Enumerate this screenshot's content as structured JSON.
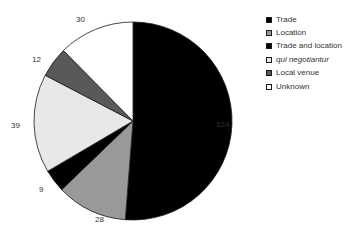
{
  "chart_data": {
    "type": "pie",
    "title": "",
    "total": 242,
    "labels": [
      "Trade",
      "Location",
      "Trade and location",
      "qui negotiantur",
      "Local venue",
      "Unknown"
    ],
    "values": [
      124,
      28,
      9,
      39,
      12,
      30
    ],
    "colors": [
      "#000000",
      "#999999",
      "#000000",
      "#e8e8e8",
      "#595959",
      "#ffffff"
    ],
    "legend_position": "right",
    "grid": false,
    "start_angle_deg": 0,
    "direction": "clockwise",
    "slices": [
      {
        "label": "Trade",
        "value": 124,
        "color": "#000000",
        "swatch": "solid-black",
        "italic": false
      },
      {
        "label": "Location",
        "value": 28,
        "color": "#999999",
        "swatch": "mid-gray",
        "italic": false
      },
      {
        "label": "Trade and location",
        "value": 9,
        "color": "#000000",
        "swatch": "solid-black",
        "italic": false
      },
      {
        "label": "qui negotiantur",
        "value": 39,
        "color": "#e8e8e8",
        "swatch": "very-light-gray",
        "italic": true
      },
      {
        "label": "Local venue",
        "value": 12,
        "color": "#595959",
        "swatch": "dark-gray",
        "italic": false
      },
      {
        "label": "Unknown",
        "value": 30,
        "color": "#ffffff",
        "swatch": "white",
        "italic": false
      }
    ],
    "data_labels": [
      {
        "text": "124",
        "x": 216,
        "y": 121
      },
      {
        "text": "28",
        "x": 95,
        "y": 216
      },
      {
        "text": "9",
        "x": 39,
        "y": 186
      },
      {
        "text": "39",
        "x": 11,
        "y": 122
      },
      {
        "text": "12",
        "x": 32,
        "y": 56
      },
      {
        "text": "30",
        "x": 76,
        "y": 16
      }
    ]
  },
  "legend": {
    "items": [
      {
        "label": "Trade"
      },
      {
        "label": "Location"
      },
      {
        "label": "Trade and location"
      },
      {
        "label": "qui negotiantur"
      },
      {
        "label": "Local venue"
      },
      {
        "label": "Unknown"
      }
    ]
  }
}
